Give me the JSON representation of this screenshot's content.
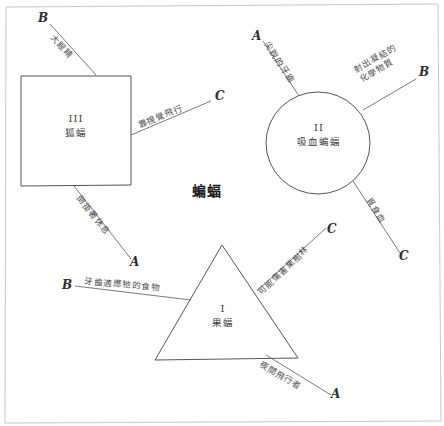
{
  "diagram": {
    "center_title": "蝙蝠",
    "shapes": [
      {
        "key": "square",
        "roman": "III",
        "name": "狐蝠"
      },
      {
        "key": "circle",
        "roman": "II",
        "name": "吸血蝙蝠"
      },
      {
        "key": "triangle",
        "roman": "I",
        "name": "果蝠"
      }
    ],
    "branches": [
      {
        "id": "sq-b",
        "endcap": "B",
        "text": "大眼睛"
      },
      {
        "id": "sq-c",
        "endcap": "C",
        "text": "靠視覺飛行"
      },
      {
        "id": "sq-a",
        "endcap": "A",
        "text": "倒掛著休息"
      },
      {
        "id": "ci-a",
        "endcap": "A",
        "text": "尖銳的牙齒"
      },
      {
        "id": "ci-b",
        "endcap": "B",
        "text": "射出凝結的\n化學物質"
      },
      {
        "id": "ci-c",
        "endcap": "C",
        "text": "覓食血"
      },
      {
        "id": "tr-b",
        "endcap": "B",
        "text": "牙齒適應牠的食物"
      },
      {
        "id": "tr-c",
        "endcap": "C",
        "text": "可能傷害果樹林"
      },
      {
        "id": "tr-a",
        "endcap": "A",
        "text": "夜間飛行者"
      }
    ]
  },
  "colors": {
    "shape_stroke": "#55555c",
    "leader_stroke": "#6b6b72",
    "frame_stroke": "#c9c9cf",
    "text": "#3b3b42",
    "title": "#1d1d22"
  }
}
